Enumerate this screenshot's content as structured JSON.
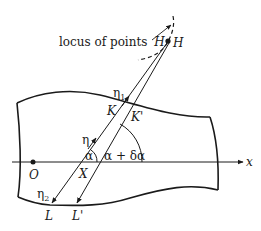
{
  "diagram": {
    "labels": {
      "locus": "locus of points",
      "locus_H": "H",
      "H": "H",
      "eta1": "η",
      "eta1_sub": "1",
      "K": "K",
      "K_prime": "K'",
      "eta": "η",
      "alpha": "α",
      "alpha_plus": "α + δα",
      "X": "X",
      "O": "O",
      "x_axis": "x",
      "eta2": "η",
      "eta2_sub": "2",
      "L": "L",
      "L_prime": "L'"
    },
    "colors": {
      "ink": "#1a1a1a",
      "background": "#ffffff"
    }
  }
}
